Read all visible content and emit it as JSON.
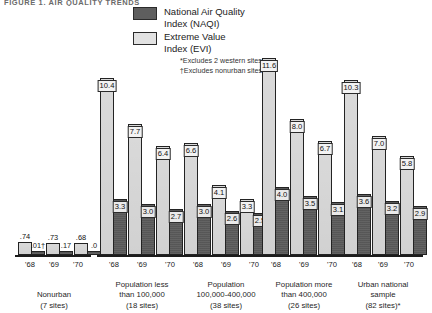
{
  "title": "FIGURE 1. AIR QUALITY TRENDS",
  "legend": {
    "items": [
      {
        "key": "naqi",
        "label": "National Air Quality\nIndex (NAQI)",
        "color": "#5e5e5e"
      },
      {
        "key": "evi",
        "label": "Extreme Value\nIndex (EVI)",
        "color": "#e2e2e2"
      }
    ],
    "notes": [
      "*Excludes 2 western sites",
      "†Excludes nonurban sites"
    ]
  },
  "chart_data": {
    "type": "bar",
    "title": "FIGURE 1. AIR QUALITY TRENDS",
    "xlabel": "",
    "ylabel": "",
    "ylim": [
      0,
      12
    ],
    "grid": false,
    "legend_position": "top-center",
    "categories": [
      "'68",
      "'69",
      "'70"
    ],
    "groups": [
      {
        "name": "Nonurban",
        "caption": "Nonurban\n(7 sites)",
        "sites": "7 sites",
        "ticks": [
          "'68",
          "'69",
          "'70"
        ],
        "series": [
          {
            "name": "National Air Quality Index (NAQI)",
            "key": "naqi",
            "values": [
              0.01,
              0.17,
              0.0
            ],
            "labels": [
              ".01†",
              ".17",
              ".0"
            ]
          },
          {
            "name": "Extreme Value Index (EVI)",
            "key": "evi",
            "values": [
              0.74,
              0.73,
              0.68
            ],
            "labels": [
              ".74",
              ".73",
              ".68"
            ]
          }
        ]
      },
      {
        "name": "Population less than 100,000",
        "caption": "Population less\nthan 100,000\n(18 sites)",
        "sites": "18 sites",
        "ticks": [
          "'68",
          "'69",
          "'70"
        ],
        "series": [
          {
            "name": "National Air Quality Index (NAQI)",
            "key": "naqi",
            "values": [
              3.3,
              3.0,
              2.7
            ],
            "labels": [
              "3.3",
              "3.0",
              "2.7"
            ]
          },
          {
            "name": "Extreme Value Index (EVI)",
            "key": "evi",
            "values": [
              10.4,
              7.7,
              6.4
            ],
            "labels": [
              "10.4",
              "7.7",
              "6.4"
            ]
          }
        ]
      },
      {
        "name": "Population 100,000-400,000",
        "caption": "Population\n100,000-400,000\n(38 sites)",
        "sites": "38 sites",
        "ticks": [
          "'68",
          "'69",
          "'70"
        ],
        "series": [
          {
            "name": "National Air Quality Index (NAQI)",
            "key": "naqi",
            "values": [
              3.0,
              2.6,
              2.5
            ],
            "labels": [
              "3.0",
              "2.6",
              "2.5"
            ]
          },
          {
            "name": "Extreme Value Index (EVI)",
            "key": "evi",
            "values": [
              6.6,
              4.1,
              3.3
            ],
            "labels": [
              "6.6",
              "4.1",
              "3.3"
            ]
          }
        ]
      },
      {
        "name": "Population more than 400,000",
        "caption": "Population more\nthan 400,000\n(26 sites)",
        "sites": "26 sites",
        "ticks": [
          "'68",
          "'69",
          "'70"
        ],
        "series": [
          {
            "name": "National Air Quality Index (NAQI)",
            "key": "naqi",
            "values": [
              4.0,
              3.5,
              3.1
            ],
            "labels": [
              "4.0",
              "3.5",
              "3.1"
            ]
          },
          {
            "name": "Extreme Value Index (EVI)",
            "key": "evi",
            "values": [
              11.6,
              8.0,
              6.7
            ],
            "labels": [
              "11.6",
              "8.0",
              "6.7"
            ]
          }
        ]
      },
      {
        "name": "Urban national sample",
        "caption": "Urban national\nsample\n(82 sites)*",
        "sites": "82 sites",
        "ticks": [
          "'68",
          "'69",
          "'70"
        ],
        "series": [
          {
            "name": "National Air Quality Index (NAQI)",
            "key": "naqi",
            "values": [
              3.6,
              3.2,
              2.9
            ],
            "labels": [
              "3.6",
              "3.2",
              "2.9"
            ]
          },
          {
            "name": "Extreme Value Index (EVI)",
            "key": "evi",
            "values": [
              10.3,
              7.0,
              5.8
            ],
            "labels": [
              "10.3",
              "7.0",
              "5.8"
            ]
          }
        ]
      }
    ]
  },
  "colors": {
    "naqi": "#5b5b5b",
    "evi": "#dedede",
    "outline": "#232323",
    "axis": "#1c1c1c",
    "background": "#ffffff"
  }
}
